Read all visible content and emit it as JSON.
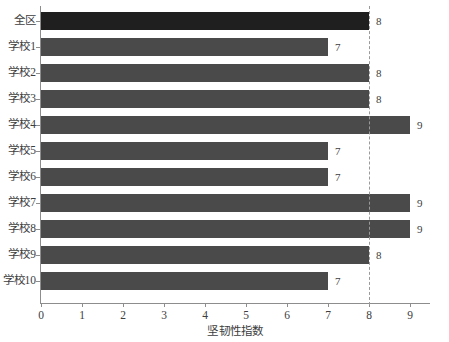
{
  "chart_data": {
    "type": "bar",
    "orientation": "horizontal",
    "title": "",
    "xlabel": "坚韧性指数",
    "ylabel": "",
    "categories": [
      "全区",
      "学校1",
      "学校2",
      "学校3",
      "学校4",
      "学校5",
      "学校6",
      "学校7",
      "学校8",
      "学校9",
      "学校10"
    ],
    "values": [
      8,
      7,
      8,
      8,
      9,
      7,
      7,
      9,
      9,
      8,
      7
    ],
    "value_labels": [
      "8",
      "7",
      "8",
      "8",
      "9",
      "7",
      "7",
      "9",
      "9",
      "8",
      "7"
    ],
    "xlim": [
      0,
      9.5
    ],
    "xticks": [
      0,
      1,
      2,
      3,
      4,
      5,
      6,
      7,
      8,
      9
    ],
    "xtick_labels": [
      "0",
      "1",
      "2",
      "3",
      "4",
      "5",
      "6",
      "7",
      "8",
      "9"
    ],
    "grid": false,
    "legend": null,
    "reference_line": {
      "axis": "x",
      "value": 8,
      "style": "dashed",
      "color": "#9a9a9a"
    },
    "bar_color": "#4a4a4a",
    "highlight_color": "#1f1f1f",
    "highlight_category": "全区",
    "background": "#ffffff"
  }
}
